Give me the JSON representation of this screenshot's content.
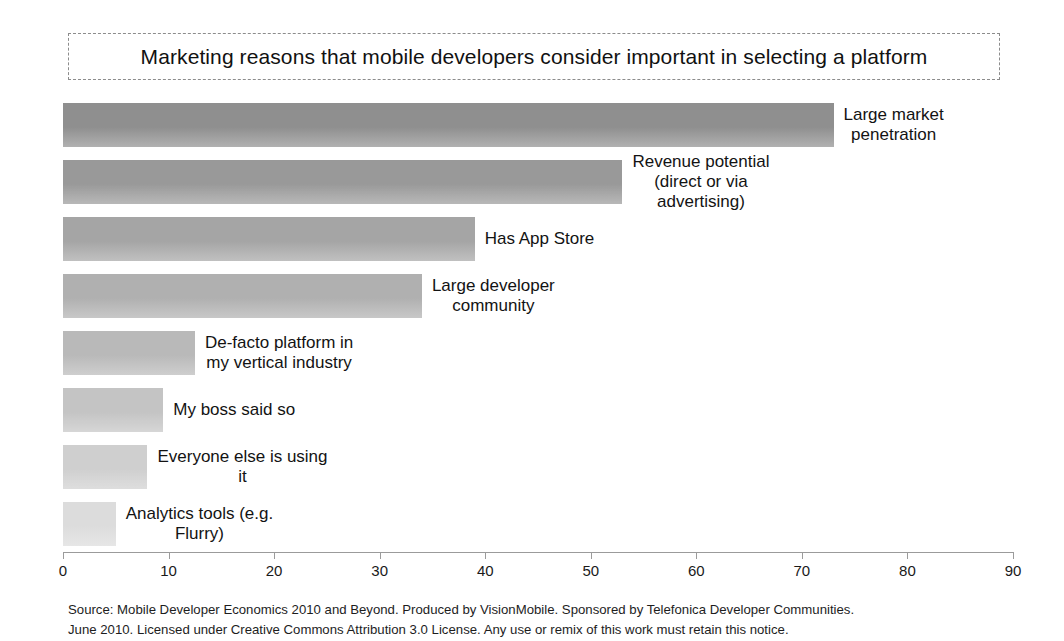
{
  "title": "Marketing reasons that mobile developers consider important in selecting a platform",
  "source": {
    "line1": "Source: Mobile Developer Economics 2010 and Beyond. Produced by VisionMobile. Sponsored by Telefonica Developer Communities.",
    "line2": "June 2010. Licensed under Creative Commons Attribution 3.0 License. Any use or remix of this work must retain this notice."
  },
  "axis": {
    "ticks": [
      "0",
      "10",
      "20",
      "30",
      "40",
      "50",
      "60",
      "70",
      "80",
      "90"
    ]
  },
  "chart_data": {
    "type": "bar",
    "orientation": "horizontal",
    "title": "Marketing reasons that mobile developers consider important in selecting a platform",
    "xlabel": "",
    "ylabel": "",
    "xlim": [
      0,
      90
    ],
    "xticks": [
      0,
      10,
      20,
      30,
      40,
      50,
      60,
      70,
      80,
      90
    ],
    "grid": false,
    "legend": false,
    "categories": [
      "Large market penetration",
      "Revenue potential (direct or via advertising)",
      "Has App Store",
      "Large developer community",
      "De-facto platform in my vertical industry",
      "My boss said so",
      "Everyone else is using it",
      "Analytics tools (e.g. Flurry)"
    ],
    "values": [
      73,
      53,
      39,
      34,
      12.5,
      9.5,
      8,
      5
    ],
    "bar_colors": [
      "#8f8f8f",
      "#999999",
      "#a5a5a5",
      "#b0b0b0",
      "#b9b9b9",
      "#c4c4c4",
      "#cfcfcf",
      "#dcdcdc"
    ],
    "bars": [
      {
        "label": "Large market\npenetration",
        "value": 73,
        "color": "#8f8f8f"
      },
      {
        "label": "Revenue potential\n(direct or via\nadvertising)",
        "value": 53,
        "color": "#999999"
      },
      {
        "label": "Has App Store",
        "value": 39,
        "color": "#a5a5a5"
      },
      {
        "label": "Large developer\ncommunity",
        "value": 34,
        "color": "#b0b0b0"
      },
      {
        "label": "De-facto platform in\nmy vertical industry",
        "value": 12.5,
        "color": "#b9b9b9"
      },
      {
        "label": "My boss said so",
        "value": 9.5,
        "color": "#c4c4c4"
      },
      {
        "label": "Everyone else is using\nit",
        "value": 8,
        "color": "#cfcfcf"
      },
      {
        "label": "Analytics tools (e.g.\nFlurry)",
        "value": 5,
        "color": "#dcdcdc"
      }
    ]
  }
}
